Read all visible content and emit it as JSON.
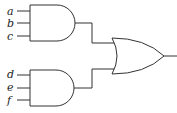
{
  "diagram": {
    "type": "logic-circuit",
    "gates": [
      {
        "id": "and1",
        "type": "AND",
        "inputs": [
          "a",
          "b",
          "c"
        ]
      },
      {
        "id": "and2",
        "type": "AND",
        "inputs": [
          "d",
          "e",
          "f"
        ]
      },
      {
        "id": "or1",
        "type": "OR",
        "inputs": [
          "and1",
          "and2"
        ]
      }
    ],
    "labels": {
      "a": "a",
      "b": "b",
      "c": "c",
      "d": "d",
      "e": "e",
      "f": "f"
    }
  }
}
